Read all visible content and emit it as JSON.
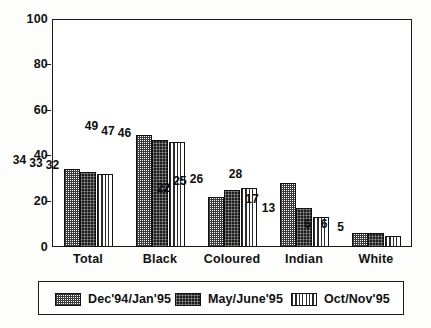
{
  "chart_data": {
    "type": "bar",
    "title": "",
    "xlabel": "",
    "ylabel": "",
    "ylim": [
      0,
      100
    ],
    "yticks": [
      0,
      20,
      40,
      60,
      80,
      100
    ],
    "grid": false,
    "legend_position": "bottom",
    "categories": [
      "Total",
      "Black",
      "Coloured",
      "Indian",
      "White"
    ],
    "series": [
      {
        "name": "Dec'94/Jan'95",
        "values": [
          34,
          49,
          22,
          28,
          6
        ],
        "pattern": "cross-hatch"
      },
      {
        "name": "May/June'95",
        "values": [
          33,
          47,
          25,
          17,
          6
        ],
        "pattern": "dark-dense"
      },
      {
        "name": "Oct/Nov'95",
        "values": [
          32,
          46,
          26,
          13,
          5
        ],
        "pattern": "vertical-stripes"
      }
    ]
  },
  "axis": {
    "y_tick_labels": [
      "100",
      "80",
      "60",
      "40",
      "20",
      "0"
    ]
  },
  "legend": {
    "items": [
      {
        "label": "Dec'94/Jan'95"
      },
      {
        "label": "May/June'95"
      },
      {
        "label": "Oct/Nov'95"
      }
    ]
  }
}
